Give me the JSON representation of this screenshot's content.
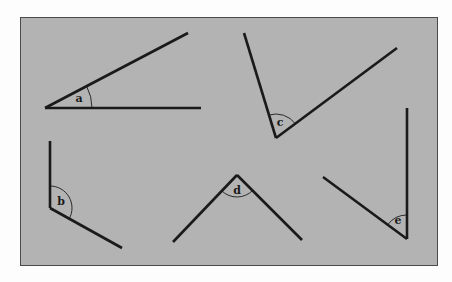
{
  "figure": {
    "background_color": "#b3b3b3",
    "line_color": "#1a1a1a",
    "angles": [
      {
        "label": "a",
        "vertex": [
          45,
          108
        ],
        "arm1": [
          188,
          33
        ],
        "arm2": [
          201,
          108
        ],
        "label_pos": [
          79,
          102
        ],
        "arc_r": 47
      },
      {
        "label": "b",
        "vertex": [
          50,
          208
        ],
        "arm1": [
          50,
          141
        ],
        "arm2": [
          122,
          248
        ],
        "label_pos": [
          61,
          205
        ],
        "arc_r": 22
      },
      {
        "label": "c",
        "vertex": [
          276,
          138
        ],
        "arm1": [
          244,
          33
        ],
        "arm2": [
          397,
          48
        ],
        "label_pos": [
          280,
          126
        ],
        "arc_r": 24
      },
      {
        "label": "d",
        "vertex": [
          237,
          175
        ],
        "arm1": [
          173,
          242
        ],
        "arm2": [
          302,
          240
        ],
        "label_pos": [
          237,
          194
        ],
        "arc_r": 22
      },
      {
        "label": "e",
        "vertex": [
          407,
          239
        ],
        "arm1": [
          407,
          108
        ],
        "arm2": [
          323,
          177
        ],
        "label_pos": [
          398,
          224
        ],
        "arc_r": 24
      }
    ]
  }
}
